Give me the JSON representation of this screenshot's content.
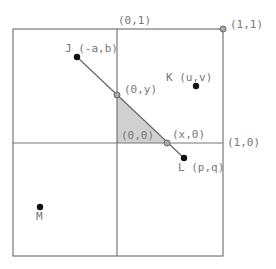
{
  "diagram": {
    "labels": {
      "top_axis": "(0,1)",
      "corner_11": "(1,1)",
      "right_axis": "(1,0)",
      "origin": "(0,0)",
      "point_0y": "(0,y)",
      "point_x0": "(x,0)",
      "J": "J (-a,b)",
      "K": "K (u,v)",
      "L": "L (p,q)",
      "M": "M"
    },
    "colors": {
      "line": "#777777",
      "shade": "#d0d0d0",
      "point": "#111111",
      "hollow_point": "#999999"
    }
  }
}
